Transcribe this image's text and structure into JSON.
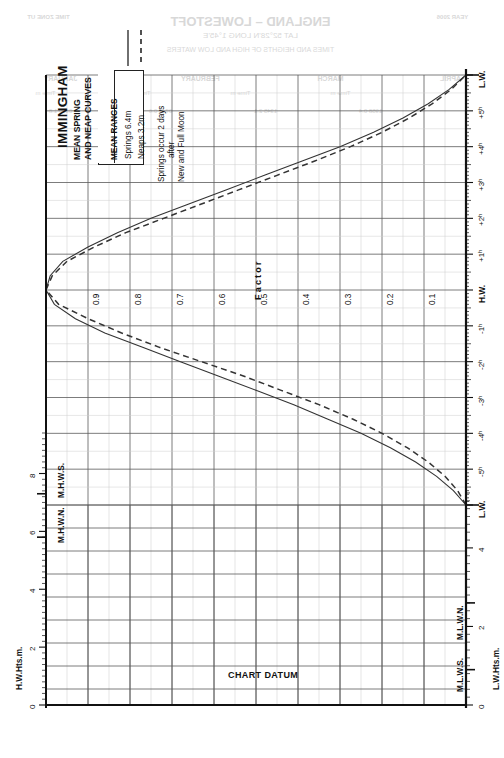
{
  "page": {
    "width": 499,
    "height": 758,
    "background": "#ffffff",
    "ink": "#111111"
  },
  "header": {
    "title": "IMMINGHAM",
    "subtitle_line1": "MEAN SPRING",
    "subtitle_line2": "AND NEAP CURVES",
    "range_box": {
      "header": "MEAN RANGES",
      "springs": "Springs 6.4m",
      "neaps": "Neaps   3.2m"
    },
    "note_line1": "Springs occur 2 days",
    "note_line2": "after",
    "note_line3": "New and Full Moon",
    "legend": [
      {
        "name": "springs",
        "style": "solid",
        "color": "#333333"
      },
      {
        "name": "neaps",
        "style": "dashed",
        "color": "#333333"
      }
    ]
  },
  "labels": {
    "chart_datum": "CHART DATUM",
    "factor_word": "Factor",
    "hw_axis_title": "H.W.Hts.m.",
    "lw_axis_title": "L.W.Hts.m.",
    "mhws": "M.H.W.S.",
    "mhwn": "M.H.W.N.",
    "mlwn": "M.L.W.N.",
    "mlws": "M.L.W.S.",
    "hw_tick": "H.W.",
    "lw_tick_left": "L.W.",
    "lw_tick_right": "L.W."
  },
  "ghost_text": [
    {
      "text": "ENGLAND – LOWESTOFT",
      "x": 250,
      "y": 14,
      "size": 13,
      "bold": true
    },
    {
      "text": "LAT 52°28'N   LONG 1°45'E",
      "x": 250,
      "y": 31,
      "size": 8,
      "bold": false
    },
    {
      "text": "TIMES AND HEIGHTS OF HIGH AND LOW WATERS",
      "x": 250,
      "y": 46,
      "size": 7,
      "bold": false
    },
    {
      "text": "TIME ZONE UT",
      "x": 48,
      "y": 14,
      "size": 6,
      "bold": true
    },
    {
      "text": "YEAR 2006",
      "x": 452,
      "y": 14,
      "size": 6,
      "bold": true
    },
    {
      "text": "JANUARY",
      "x": 60,
      "y": 75,
      "size": 7,
      "bold": true
    },
    {
      "text": "FEBRUARY",
      "x": 200,
      "y": 75,
      "size": 7,
      "bold": true
    },
    {
      "text": "MARCH",
      "x": 330,
      "y": 75,
      "size": 7,
      "bold": true
    },
    {
      "text": "APRIL",
      "x": 450,
      "y": 75,
      "size": 7,
      "bold": true
    },
    {
      "text": "Time  m",
      "x": 45,
      "y": 90,
      "size": 6,
      "bold": false
    },
    {
      "text": "Time  m",
      "x": 140,
      "y": 90,
      "size": 6,
      "bold": false
    },
    {
      "text": "Time  m",
      "x": 240,
      "y": 90,
      "size": 6,
      "bold": false
    },
    {
      "text": "Time  m",
      "x": 340,
      "y": 90,
      "size": 6,
      "bold": false
    },
    {
      "text": "0120  1.8",
      "x": 60,
      "y": 108,
      "size": 6,
      "bold": false
    },
    {
      "text": "0743  0.6",
      "x": 160,
      "y": 108,
      "size": 6,
      "bold": false
    },
    {
      "text": "1345  2.1",
      "x": 265,
      "y": 108,
      "size": 6,
      "bold": false
    },
    {
      "text": "1958  0.4",
      "x": 370,
      "y": 108,
      "size": 6,
      "bold": false
    }
  ],
  "chart_data": {
    "type": "line",
    "orientation": "rotated-90",
    "xlabel": "Time relative to High Water (hours)",
    "ylabel": "Factor",
    "grid": true,
    "legend_position": "top-left",
    "xlim": [
      -6,
      6
    ],
    "ylim": [
      0,
      1
    ],
    "x_tick_labels": [
      "L.W.",
      "-5ʰ",
      "-4ʰ",
      "-3ʰ",
      "-2ʰ",
      "-1ʰ",
      "H.W.",
      "+1ʰ",
      "+2ʰ",
      "+3ʰ",
      "+4ʰ",
      "+5ʰ",
      "L.W."
    ],
    "x_tick_values": [
      -6,
      -5,
      -4,
      -3,
      -2,
      -1,
      0,
      1,
      2,
      3,
      4,
      5,
      6
    ],
    "factor_tick_labels": [
      "0.1",
      "0.2",
      "0.3",
      "0.4",
      "0.5",
      "0.6",
      "0.7",
      "0.8",
      "0.9"
    ],
    "factor_tick_values": [
      0.1,
      0.2,
      0.3,
      0.4,
      0.5,
      0.6,
      0.7,
      0.8,
      0.9
    ],
    "hw_height_scale": {
      "title": "H.W.Hts.m.",
      "ticks": [
        0,
        2,
        4,
        6,
        8
      ],
      "min": 0,
      "max": 9.4,
      "markers": [
        {
          "label": "M.H.W.S.",
          "value": 7.3
        },
        {
          "label": "M.H.W.N.",
          "value": 5.8
        }
      ]
    },
    "lw_height_scale": {
      "title": "L.W.Hts.m.",
      "ticks": [
        0,
        2,
        4
      ],
      "min": 0,
      "max": 5.5,
      "markers": [
        {
          "label": "M.L.W.N.",
          "value": 2.6
        },
        {
          "label": "M.L.W.S.",
          "value": 0.9
        }
      ]
    },
    "mean_ranges": {
      "springs_m": 6.4,
      "neaps_m": 3.2
    },
    "series": [
      {
        "name": "Mean Spring Curve",
        "style": "solid",
        "color": "#333333",
        "x": [
          -6.0,
          -5.6,
          -5.2,
          -4.8,
          -4.4,
          -4.0,
          -3.6,
          -3.2,
          -2.8,
          -2.4,
          -2.0,
          -1.6,
          -1.2,
          -0.8,
          -0.4,
          0.0,
          0.4,
          0.8,
          1.2,
          1.6,
          2.0,
          2.4,
          2.8,
          3.2,
          3.6,
          4.0,
          4.4,
          4.8,
          5.2,
          5.6,
          6.0
        ],
        "factor": [
          0.0,
          0.03,
          0.07,
          0.12,
          0.18,
          0.25,
          0.33,
          0.41,
          0.5,
          0.59,
          0.68,
          0.77,
          0.86,
          0.93,
          0.98,
          1.0,
          0.99,
          0.96,
          0.9,
          0.83,
          0.75,
          0.66,
          0.57,
          0.48,
          0.39,
          0.3,
          0.22,
          0.15,
          0.09,
          0.04,
          0.0
        ]
      },
      {
        "name": "Mean Neap Curve",
        "style": "dashed",
        "color": "#333333",
        "x": [
          -6.0,
          -5.6,
          -5.2,
          -4.8,
          -4.4,
          -4.0,
          -3.6,
          -3.2,
          -2.8,
          -2.4,
          -2.0,
          -1.6,
          -1.2,
          -0.8,
          -0.4,
          0.0,
          0.4,
          0.8,
          1.2,
          1.6,
          2.0,
          2.4,
          2.8,
          3.2,
          3.6,
          4.0,
          4.4,
          4.8,
          5.2,
          5.6,
          6.0
        ],
        "factor": [
          0.0,
          0.02,
          0.05,
          0.09,
          0.14,
          0.2,
          0.27,
          0.35,
          0.44,
          0.53,
          0.63,
          0.73,
          0.82,
          0.9,
          0.97,
          1.0,
          0.985,
          0.95,
          0.885,
          0.81,
          0.72,
          0.63,
          0.54,
          0.45,
          0.36,
          0.275,
          0.2,
          0.135,
          0.08,
          0.035,
          0.0
        ]
      }
    ]
  }
}
